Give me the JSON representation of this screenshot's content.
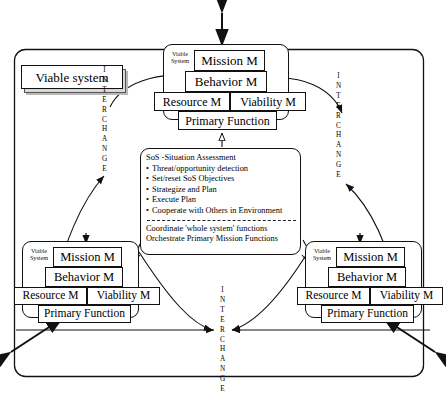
{
  "diagram": {
    "title_top_arrow": "bidirectional-external-interchange",
    "legend": {
      "label": "Viable system"
    },
    "viable_system_label": "Viable\nSystem",
    "clusters": [
      {
        "id": "top",
        "group_label": "Viable\nSystem",
        "mission": "Mission M",
        "behavior": "Behavior M",
        "resource": "Resource M",
        "viability": "Viability M",
        "primary": "Primary Function"
      },
      {
        "id": "bottom-left",
        "group_label": "Viable\nSystem",
        "mission": "Mission M",
        "behavior": "Behavior M",
        "resource": "Resource M",
        "viability": "Viability M",
        "primary": "Primary Function"
      },
      {
        "id": "bottom-right",
        "group_label": "Viable\nSystem",
        "mission": "Mission M",
        "behavior": "Behavior M",
        "resource": "Resource M",
        "viability": "Viability M",
        "primary": "Primary Function"
      }
    ],
    "sos": {
      "header": "SoS -Situation Assessment",
      "bullets": [
        "Threat/opportunity detection",
        "Set/reset SoS Objectives",
        "Strategize and Plan",
        "Execute Plan",
        "Cooperate with Others in Environment"
      ],
      "footer_line1": "Coordinate  'whole system' functions",
      "footer_line2": "Orchestrate Primary Mission Functions"
    },
    "interchange_labels": {
      "left": "INTERCHANGE",
      "right": "INTERCHANGE",
      "bottom": "INTERCHANGE"
    },
    "colors": {
      "stroke": "#111111",
      "background": "#ffffff",
      "legend_fill": "#d8d8d8",
      "shadow": "#b9b9b9"
    }
  }
}
